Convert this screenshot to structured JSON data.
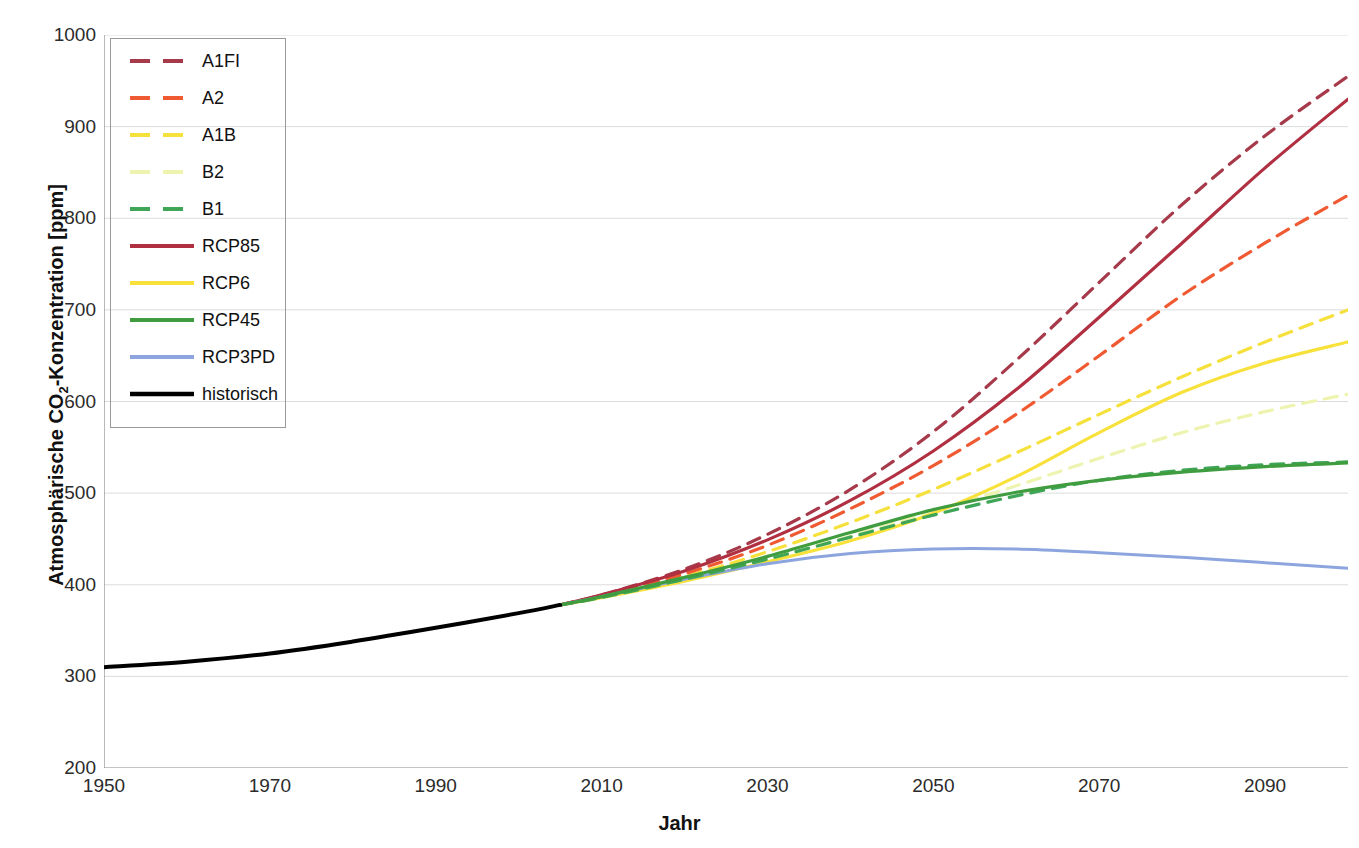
{
  "chart_data": {
    "type": "line",
    "title": "",
    "xlabel": "Jahr",
    "ylabel": "Atmosphärische CO2-Konzentration [ppm]",
    "ylabel_prefix": "Atmosphärische CO",
    "ylabel_sub": "2",
    "ylabel_suffix": "-Konzentration [ppm]",
    "xlim": [
      1950,
      2100
    ],
    "ylim": [
      200,
      1000
    ],
    "grid": true,
    "grid_axis": "y",
    "legend_position": "upper-left",
    "xticks": [
      1950,
      1970,
      1990,
      2010,
      2030,
      2050,
      2070,
      2090
    ],
    "xtick_labels": [
      "1950",
      "1970",
      "1990",
      "2010",
      "2030",
      "2050",
      "2070",
      "2090"
    ],
    "yticks": [
      200,
      300,
      400,
      500,
      600,
      700,
      800,
      900,
      1000
    ],
    "ytick_labels": [
      "200",
      "300",
      "400",
      "500",
      "600",
      "700",
      "800",
      "900",
      "1000"
    ],
    "series": [
      {
        "name": "A1FI",
        "color": "#a63a4a",
        "style": "dashed",
        "width": 3.2,
        "x": [
          2005,
          2010,
          2020,
          2030,
          2040,
          2050,
          2060,
          2070,
          2080,
          2090,
          2100
        ],
        "values": [
          378,
          389,
          417,
          455,
          504,
          567,
          645,
          730,
          815,
          890,
          955
        ]
      },
      {
        "name": "A2",
        "color": "#f05a32",
        "style": "dashed",
        "width": 3.2,
        "x": [
          2005,
          2010,
          2020,
          2030,
          2040,
          2050,
          2060,
          2070,
          2080,
          2090,
          2100
        ],
        "values": [
          378,
          388,
          412,
          443,
          483,
          530,
          586,
          650,
          716,
          773,
          825
        ]
      },
      {
        "name": "A1B",
        "color": "#f5e03c",
        "style": "dashed",
        "width": 3.2,
        "x": [
          2005,
          2010,
          2020,
          2030,
          2040,
          2050,
          2060,
          2070,
          2080,
          2090,
          2100
        ],
        "values": [
          378,
          387,
          409,
          436,
          468,
          504,
          544,
          586,
          627,
          665,
          700
        ]
      },
      {
        "name": "B2",
        "color": "#eef4b0",
        "style": "dashed",
        "width": 3.2,
        "x": [
          2005,
          2010,
          2020,
          2030,
          2040,
          2050,
          2060,
          2070,
          2080,
          2090,
          2100
        ],
        "values": [
          378,
          386,
          406,
          428,
          453,
          480,
          508,
          538,
          566,
          589,
          608
        ]
      },
      {
        "name": "B1",
        "color": "#3fa557",
        "style": "dashed",
        "width": 3.2,
        "x": [
          2005,
          2010,
          2020,
          2030,
          2040,
          2050,
          2060,
          2070,
          2080,
          2090,
          2100
        ],
        "values": [
          378,
          386,
          406,
          428,
          452,
          476,
          497,
          514,
          525,
          531,
          534
        ]
      },
      {
        "name": "RCP85",
        "color": "#b03042",
        "style": "solid",
        "width": 3.2,
        "x": [
          2005,
          2010,
          2020,
          2030,
          2040,
          2050,
          2060,
          2070,
          2080,
          2090,
          2100
        ],
        "values": [
          378,
          389,
          415,
          449,
          492,
          546,
          613,
          692,
          773,
          855,
          930
        ]
      },
      {
        "name": "RCP6",
        "color": "#f7e13a",
        "style": "solid",
        "width": 3.2,
        "x": [
          2005,
          2010,
          2020,
          2030,
          2040,
          2050,
          2060,
          2070,
          2080,
          2090,
          2100
        ],
        "values": [
          378,
          386,
          404,
          425,
          448,
          478,
          518,
          566,
          610,
          642,
          665
        ]
      },
      {
        "name": "RCP45",
        "color": "#3f9c3f",
        "style": "solid",
        "width": 3.2,
        "x": [
          2005,
          2010,
          2020,
          2030,
          2040,
          2050,
          2060,
          2070,
          2080,
          2090,
          2100
        ],
        "values": [
          378,
          387,
          408,
          431,
          457,
          482,
          501,
          514,
          523,
          529,
          533
        ]
      },
      {
        "name": "RCP3PD",
        "color": "#8da5de",
        "style": "solid",
        "width": 3.0,
        "x": [
          2005,
          2010,
          2020,
          2030,
          2040,
          2050,
          2060,
          2070,
          2080,
          2090,
          2100
        ],
        "values": [
          378,
          387,
          406,
          423,
          434,
          439,
          439,
          435,
          430,
          424,
          418
        ]
      },
      {
        "name": "historisch",
        "color": "#000000",
        "style": "solid",
        "width": 4.0,
        "x": [
          1950,
          1960,
          1970,
          1980,
          1990,
          2000,
          2005
        ],
        "values": [
          310,
          316,
          325,
          338,
          353,
          369,
          378
        ]
      }
    ]
  },
  "legend": {
    "items": [
      {
        "label": "A1FI",
        "color": "#a63a4a",
        "style": "dashed"
      },
      {
        "label": "A2",
        "color": "#f05a32",
        "style": "dashed"
      },
      {
        "label": "A1B",
        "color": "#f5e03c",
        "style": "dashed"
      },
      {
        "label": "B2",
        "color": "#eef4b0",
        "style": "dashed"
      },
      {
        "label": "B1",
        "color": "#3fa557",
        "style": "dashed"
      },
      {
        "label": "RCP85",
        "color": "#b03042",
        "style": "solid"
      },
      {
        "label": "RCP6",
        "color": "#f7e13a",
        "style": "solid"
      },
      {
        "label": "RCP45",
        "color": "#3f9c3f",
        "style": "solid"
      },
      {
        "label": "RCP3PD",
        "color": "#8da5de",
        "style": "solid"
      },
      {
        "label": "historisch",
        "color": "#000000",
        "style": "solid"
      }
    ]
  },
  "colors": {
    "axis": "#8a8a8a",
    "grid": "#dcdcdc",
    "text": "#1a1a1a",
    "background": "#ffffff"
  }
}
